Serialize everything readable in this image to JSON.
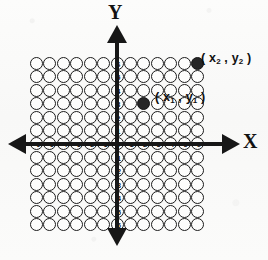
{
  "figure": {
    "type": "coordinate-plane",
    "axes": {
      "x_label": "X",
      "y_label": "Y",
      "x_ticks": [
        -6,
        -5,
        -4,
        -3,
        -2,
        -1,
        0,
        1,
        2,
        3,
        4,
        5,
        6
      ],
      "y_ticks": [
        6,
        5,
        4,
        3,
        2,
        1,
        0,
        -1,
        -2,
        -3,
        -4,
        -5,
        -6
      ],
      "origin_label": "0",
      "x_range": [
        -6,
        6
      ],
      "y_range": [
        -6,
        6
      ],
      "arrow_ends": [
        "left",
        "right",
        "up",
        "down"
      ]
    },
    "grid": {
      "marker": "open-circle",
      "columns": 13,
      "rows": 13,
      "cols_from": -6,
      "cols_to": 6,
      "rows_from": -6,
      "rows_to": 6
    },
    "points": [
      {
        "name": "point-1",
        "x": 2,
        "y": 3,
        "marker": "filled-circle",
        "label_prefix": "( ",
        "label_x_var": "x",
        "label_x_sub": "1",
        "label_sep": " , ",
        "label_y_var": "y",
        "label_y_sub": "1",
        "label_suffix": " )"
      },
      {
        "name": "point-2",
        "x": 6,
        "y": 6,
        "marker": "filled-circle",
        "label_prefix": "( ",
        "label_x_var": "x",
        "label_x_sub": "2",
        "label_sep": " , ",
        "label_y_var": "y",
        "label_y_sub": "2",
        "label_suffix": " )"
      }
    ],
    "colors": {
      "ink": "#171717",
      "circle_stroke": "#1b1b1b",
      "filled_point": "#262626",
      "paper": "#fbfbfa"
    }
  },
  "chart_data": {
    "type": "scatter",
    "title": "",
    "xlabel": "X",
    "ylabel": "Y",
    "xlim": [
      -6,
      6
    ],
    "ylim": [
      -6,
      6
    ],
    "grid": true,
    "legend": "none",
    "series": [
      {
        "name": "labeled-points",
        "points": [
          {
            "x": 2,
            "y": 3,
            "label": "( x1 , y1 )"
          },
          {
            "x": 6,
            "y": 6,
            "label": "( x2 , y2 )"
          }
        ]
      }
    ],
    "xticks": [
      -6,
      -5,
      -4,
      -3,
      -2,
      -1,
      0,
      1,
      2,
      3,
      4,
      5,
      6
    ],
    "yticks": [
      -6,
      -5,
      -4,
      -3,
      -2,
      -1,
      0,
      1,
      2,
      3,
      4,
      5,
      6
    ]
  }
}
